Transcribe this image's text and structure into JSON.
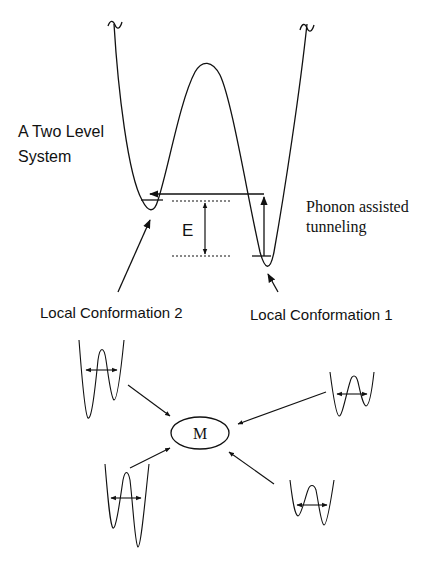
{
  "diagram": {
    "title_line1": "A Two Level",
    "title_line2": "System",
    "energy_label": "E",
    "tunneling_line1": "Phonon assisted",
    "tunneling_line2": "tunneling",
    "conformation_2": "Local Conformation 2",
    "conformation_1": "Local Conformation 1",
    "center_label": "M",
    "break_symbol": "~",
    "colors": {
      "stroke": "#111111",
      "background": "#ffffff"
    }
  }
}
